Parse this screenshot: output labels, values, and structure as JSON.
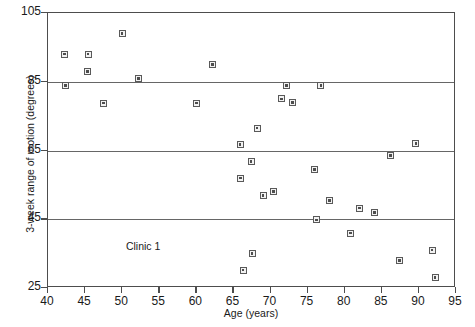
{
  "chart_data": {
    "type": "scatter",
    "title": "",
    "xlabel": "Age (years)",
    "ylabel": "3-week range of motion (degrees)",
    "xlim": [
      40,
      95
    ],
    "ylim": [
      25,
      105
    ],
    "xticks": [
      40,
      45,
      50,
      55,
      60,
      65,
      70,
      75,
      80,
      85,
      90,
      95
    ],
    "yticks": [
      25,
      45,
      65,
      85,
      105
    ],
    "gridlines_y": [
      45,
      65,
      85
    ],
    "grid": "horizontal-only",
    "legend": "none",
    "annotations": [
      {
        "text": "Clinic 1",
        "x": 50.5,
        "y": 37
      }
    ],
    "marker": {
      "shape": "square-with-center-dot",
      "edge_color": "#595959",
      "face_color": "#f2f2f2",
      "size_px": 7
    },
    "series": [
      {
        "name": "Clinic 1 patients",
        "points": [
          {
            "x": 42.2,
            "y": 93.0
          },
          {
            "x": 42.4,
            "y": 83.8
          },
          {
            "x": 45.3,
            "y": 88.0
          },
          {
            "x": 45.4,
            "y": 93.0
          },
          {
            "x": 47.5,
            "y": 78.8
          },
          {
            "x": 50.0,
            "y": 99.0
          },
          {
            "x": 52.2,
            "y": 86.0
          },
          {
            "x": 60.0,
            "y": 78.8
          },
          {
            "x": 62.2,
            "y": 90.0
          },
          {
            "x": 65.9,
            "y": 66.8
          },
          {
            "x": 66.0,
            "y": 57.0
          },
          {
            "x": 66.3,
            "y": 30.2
          },
          {
            "x": 67.4,
            "y": 61.8
          },
          {
            "x": 67.5,
            "y": 35.0
          },
          {
            "x": 68.2,
            "y": 71.5
          },
          {
            "x": 69.0,
            "y": 51.8
          },
          {
            "x": 70.4,
            "y": 53.0
          },
          {
            "x": 71.5,
            "y": 80.0
          },
          {
            "x": 72.2,
            "y": 83.8
          },
          {
            "x": 73.0,
            "y": 79.0
          },
          {
            "x": 75.9,
            "y": 59.5
          },
          {
            "x": 76.2,
            "y": 44.8
          },
          {
            "x": 76.8,
            "y": 83.8
          },
          {
            "x": 78.0,
            "y": 50.5
          },
          {
            "x": 80.8,
            "y": 41.0
          },
          {
            "x": 82.0,
            "y": 48.2
          },
          {
            "x": 84.0,
            "y": 47.0
          },
          {
            "x": 86.2,
            "y": 63.5
          },
          {
            "x": 87.4,
            "y": 33.0
          },
          {
            "x": 89.6,
            "y": 67.0
          },
          {
            "x": 91.8,
            "y": 36.0
          },
          {
            "x": 92.2,
            "y": 28.0
          }
        ]
      }
    ]
  }
}
